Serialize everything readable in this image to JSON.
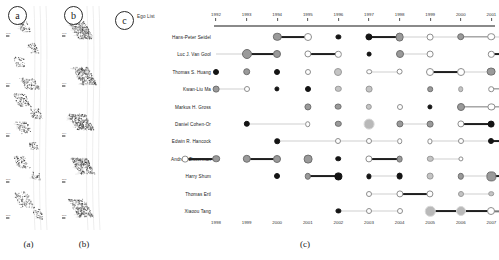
{
  "figure": {
    "panels": [
      {
        "tag": "a",
        "caption": "(a)"
      },
      {
        "tag": "b",
        "caption": "(b)"
      },
      {
        "tag": "c",
        "caption": "(c)"
      }
    ]
  },
  "panel_a": {
    "tag": "a",
    "caption": "(a)",
    "year_ticks": [
      "1993",
      "1996",
      "1999",
      "2002",
      "2005"
    ]
  },
  "panel_b": {
    "tag": "b",
    "caption": "(b)",
    "year_ticks": [
      "1993",
      "1996",
      "1999",
      "2002",
      "2005"
    ]
  },
  "panel_c": {
    "tag": "c",
    "caption": "(c)",
    "header": "Ego List",
    "axis_top": [
      "1992",
      "1993",
      "1994",
      "1995",
      "1996",
      "1997",
      "1998",
      "1999",
      "2000",
      "2001"
    ],
    "axis_bottom": [
      "1998",
      "1999",
      "2000",
      "2001",
      "2002",
      "2003",
      "2004",
      "2005",
      "2006",
      "2007"
    ]
  },
  "chart_data": {
    "type": "scatter",
    "title": "Ego List",
    "xlabel": "",
    "ylabel": "",
    "grid": false,
    "legend": "none",
    "axis_top_ticks": [
      "1992",
      "1993",
      "1994",
      "1995",
      "1996",
      "1997",
      "1998",
      "1999",
      "2000",
      "2001"
    ],
    "axis_bottom_ticks": [
      "1998",
      "1999",
      "2000",
      "2001",
      "2002",
      "2003",
      "2004",
      "2005",
      "2006",
      "2007"
    ],
    "columns": 10,
    "marker_styles": [
      "solid",
      "gray",
      "light",
      "open",
      "ring",
      "halo"
    ],
    "link_styles": [
      "light",
      "mid",
      "strong"
    ],
    "series": [
      {
        "name": "Hans-Peter Seidel",
        "points": [
          {
            "col": 2,
            "style": "gray",
            "size": 4.2
          },
          {
            "col": 3,
            "style": "ring",
            "size": 4.0
          },
          {
            "col": 4,
            "style": "solid",
            "size": 2.6
          },
          {
            "col": 5,
            "style": "solid",
            "size": 3.6
          },
          {
            "col": 6,
            "style": "gray",
            "size": 4.4
          },
          {
            "col": 7,
            "style": "ring",
            "size": 3.4
          },
          {
            "col": 8,
            "style": "gray",
            "size": 3.8
          },
          {
            "col": 9,
            "style": "ring",
            "size": 3.8
          }
        ],
        "links": [
          {
            "from": 2,
            "to": 3,
            "style": "strong"
          },
          {
            "from": 5,
            "to": 6,
            "style": "strong"
          },
          {
            "from": 6,
            "to": 7,
            "style": "light"
          },
          {
            "from": 7,
            "to": 8,
            "style": "light"
          },
          {
            "from": 8,
            "to": 9,
            "style": "mid"
          },
          {
            "from": 9,
            "to": 10,
            "style": "light"
          }
        ]
      },
      {
        "name": "Luc J. Van Gool",
        "points": [
          {
            "col": 1,
            "style": "gray",
            "size": 5.0
          },
          {
            "col": 2,
            "style": "gray",
            "size": 4.0
          },
          {
            "col": 3,
            "style": "ring",
            "size": 3.6
          },
          {
            "col": 4,
            "style": "ring",
            "size": 3.2
          },
          {
            "col": 5,
            "style": "solid",
            "size": 2.4
          },
          {
            "col": 6,
            "style": "gray",
            "size": 4.0
          },
          {
            "col": 7,
            "style": "ring",
            "size": 3.4
          },
          {
            "col": 9,
            "style": "ring",
            "size": 3.2
          }
        ],
        "links": [
          {
            "from": 0,
            "to": 1,
            "style": "light"
          },
          {
            "from": 1,
            "to": 2,
            "style": "strong"
          },
          {
            "from": 3,
            "to": 4,
            "style": "strong"
          },
          {
            "from": 6,
            "to": 7,
            "style": "light"
          },
          {
            "from": 9,
            "to": 10,
            "style": "strong"
          }
        ]
      },
      {
        "name": "Thomas S. Huang",
        "points": [
          {
            "col": 0,
            "style": "solid",
            "size": 3.0
          },
          {
            "col": 1,
            "style": "gray",
            "size": 3.8
          },
          {
            "col": 2,
            "style": "solid",
            "size": 3.0
          },
          {
            "col": 3,
            "style": "ring",
            "size": 3.0
          },
          {
            "col": 4,
            "style": "light",
            "size": 4.0
          },
          {
            "col": 5,
            "style": "ring",
            "size": 2.8
          },
          {
            "col": 6,
            "style": "ring",
            "size": 3.4
          },
          {
            "col": 7,
            "style": "ring",
            "size": 4.0
          },
          {
            "col": 8,
            "style": "ring",
            "size": 4.0
          },
          {
            "col": 9,
            "style": "gray",
            "size": 4.4
          }
        ],
        "links": [
          {
            "from": 5,
            "to": 6,
            "style": "light"
          },
          {
            "from": 7,
            "to": 8,
            "style": "strong"
          },
          {
            "from": 8,
            "to": 9,
            "style": "light"
          }
        ]
      },
      {
        "name": "Kwan-Liu Ma",
        "points": [
          {
            "col": 0,
            "style": "gray",
            "size": 3.4
          },
          {
            "col": 1,
            "style": "ring",
            "size": 3.0
          },
          {
            "col": 2,
            "style": "solid",
            "size": 2.6
          },
          {
            "col": 3,
            "style": "solid",
            "size": 3.0
          },
          {
            "col": 4,
            "style": "light",
            "size": 3.2
          },
          {
            "col": 5,
            "style": "light",
            "size": 3.4
          },
          {
            "col": 7,
            "style": "gray",
            "size": 2.8
          },
          {
            "col": 8,
            "style": "light",
            "size": 2.8
          },
          {
            "col": 9,
            "style": "ring",
            "size": 2.8
          }
        ],
        "links": [
          {
            "from": 0,
            "to": 1,
            "style": "light"
          },
          {
            "from": 9,
            "to": 10,
            "style": "mid"
          }
        ]
      },
      {
        "name": "Markus H. Gross",
        "points": [
          {
            "col": 3,
            "style": "gray",
            "size": 3.6
          },
          {
            "col": 4,
            "style": "gray",
            "size": 3.4
          },
          {
            "col": 5,
            "style": "light",
            "size": 3.2
          },
          {
            "col": 6,
            "style": "ring",
            "size": 3.0
          },
          {
            "col": 7,
            "style": "solid",
            "size": 2.6
          },
          {
            "col": 8,
            "style": "gray",
            "size": 4.0
          },
          {
            "col": 9,
            "style": "ring",
            "size": 3.6
          }
        ],
        "links": [
          {
            "from": 8,
            "to": 9,
            "style": "mid"
          },
          {
            "from": 9,
            "to": 10,
            "style": "mid"
          }
        ]
      },
      {
        "name": "Daniel Cohen-Or",
        "points": [
          {
            "col": 1,
            "style": "solid",
            "size": 3.2
          },
          {
            "col": 3,
            "style": "ring",
            "size": 2.8
          },
          {
            "col": 4,
            "style": "gray",
            "size": 3.2
          },
          {
            "col": 5,
            "style": "halo",
            "size": 5.4
          },
          {
            "col": 6,
            "style": "gray",
            "size": 3.6
          },
          {
            "col": 7,
            "style": "gray",
            "size": 3.4
          },
          {
            "col": 8,
            "style": "ring",
            "size": 3.6
          },
          {
            "col": 9,
            "style": "solid",
            "size": 3.4
          }
        ],
        "links": [
          {
            "from": 1,
            "to": 3,
            "style": "light"
          },
          {
            "from": 6,
            "to": 7,
            "style": "light"
          },
          {
            "from": 8,
            "to": 9,
            "style": "strong"
          }
        ]
      },
      {
        "name": "Edwin R. Hancock",
        "points": [
          {
            "col": 2,
            "style": "solid",
            "size": 2.8
          },
          {
            "col": 4,
            "style": "ring",
            "size": 3.0
          },
          {
            "col": 5,
            "style": "ring",
            "size": 3.0
          },
          {
            "col": 6,
            "style": "ring",
            "size": 2.8
          },
          {
            "col": 7,
            "style": "ring",
            "size": 2.6
          },
          {
            "col": 8,
            "style": "ring",
            "size": 3.0
          },
          {
            "col": 9,
            "style": "solid",
            "size": 3.0
          }
        ],
        "links": [
          {
            "from": 2,
            "to": 4,
            "style": "light"
          },
          {
            "from": 4,
            "to": 5,
            "style": "light"
          },
          {
            "from": 5,
            "to": 6,
            "style": "light"
          },
          {
            "from": 7,
            "to": 8,
            "style": "light"
          },
          {
            "from": 8,
            "to": 9,
            "style": "light"
          },
          {
            "from": 9,
            "to": 10,
            "style": "strong"
          }
        ]
      },
      {
        "name": "Andrew Zisserman",
        "points": [
          {
            "col": -1,
            "style": "ring",
            "size": 3.4
          },
          {
            "col": 0,
            "style": "gray",
            "size": 3.8
          },
          {
            "col": 1,
            "style": "gray",
            "size": 4.2
          },
          {
            "col": 2,
            "style": "gray",
            "size": 4.0
          },
          {
            "col": 3,
            "style": "gray",
            "size": 4.4
          },
          {
            "col": 4,
            "style": "solid",
            "size": 2.8
          },
          {
            "col": 5,
            "style": "ring",
            "size": 3.6
          },
          {
            "col": 6,
            "style": "gray",
            "size": 3.4
          },
          {
            "col": 7,
            "style": "light",
            "size": 3.2
          },
          {
            "col": 8,
            "style": "ring",
            "size": 2.6
          }
        ],
        "links": [
          {
            "from": -1,
            "to": 0,
            "style": "strong"
          },
          {
            "from": 1,
            "to": 2,
            "style": "strong"
          },
          {
            "from": 5,
            "to": 6,
            "style": "strong"
          },
          {
            "from": 7,
            "to": 8,
            "style": "light"
          }
        ]
      },
      {
        "name": "Harry Shum",
        "points": [
          {
            "col": 2,
            "style": "solid",
            "size": 3.0
          },
          {
            "col": 3,
            "style": "gray",
            "size": 3.2
          },
          {
            "col": 4,
            "style": "solid",
            "size": 3.6
          },
          {
            "col": 5,
            "style": "solid",
            "size": 2.6
          },
          {
            "col": 6,
            "style": "solid",
            "size": 3.4
          },
          {
            "col": 7,
            "style": "light",
            "size": 3.4
          },
          {
            "col": 8,
            "style": "gray",
            "size": 3.2
          },
          {
            "col": 9,
            "style": "gray",
            "size": 4.6
          }
        ],
        "links": [
          {
            "from": 3,
            "to": 4,
            "style": "strong"
          },
          {
            "from": 5,
            "to": 6,
            "style": "light"
          },
          {
            "from": 8,
            "to": 9,
            "style": "light"
          },
          {
            "from": 9,
            "to": 10,
            "style": "strong"
          }
        ]
      },
      {
        "name": "Thomas Ertl",
        "points": [
          {
            "col": 5,
            "style": "ring",
            "size": 3.0
          },
          {
            "col": 6,
            "style": "ring",
            "size": 3.6
          },
          {
            "col": 7,
            "style": "ring",
            "size": 3.6
          },
          {
            "col": 8,
            "style": "light",
            "size": 3.0
          },
          {
            "col": 9,
            "style": "light",
            "size": 2.8
          }
        ],
        "links": [
          {
            "from": 5,
            "to": 6,
            "style": "light"
          },
          {
            "from": 6,
            "to": 7,
            "style": "strong"
          },
          {
            "from": 8,
            "to": 9,
            "style": "light"
          }
        ]
      },
      {
        "name": "Xiaoou Tang",
        "points": [
          {
            "col": 4,
            "style": "solid",
            "size": 2.6
          },
          {
            "col": 5,
            "style": "ring",
            "size": 3.0
          },
          {
            "col": 6,
            "style": "ring",
            "size": 3.0
          },
          {
            "col": 7,
            "style": "halo",
            "size": 5.2
          },
          {
            "col": 8,
            "style": "halo",
            "size": 5.0
          },
          {
            "col": 9,
            "style": "ring",
            "size": 4.0
          }
        ],
        "links": [
          {
            "from": 4,
            "to": 5,
            "style": "light"
          },
          {
            "from": 5,
            "to": 6,
            "style": "light"
          },
          {
            "from": 7,
            "to": 8,
            "style": "strong"
          },
          {
            "from": 8,
            "to": 9,
            "style": "strong"
          },
          {
            "from": 9,
            "to": 10,
            "style": "mid"
          }
        ]
      }
    ]
  }
}
